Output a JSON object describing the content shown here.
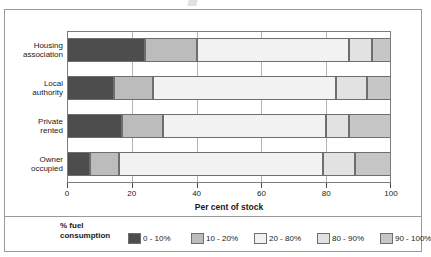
{
  "figure": {
    "frame_visible": true
  },
  "chart_data": {
    "type": "bar",
    "orientation": "horizontal",
    "stacked": true,
    "stack_mode": "percent",
    "title": "",
    "xlabel": "Per cent of stock",
    "ylabel": "",
    "xlim": [
      0,
      100
    ],
    "xticks": [
      0,
      20,
      40,
      60,
      80,
      100
    ],
    "xticklabels": [
      "0",
      "20",
      "40",
      "60",
      "80",
      "100"
    ],
    "grid": true,
    "grid_axis": "x",
    "legend_title": "% fuel consumption",
    "legend_position": "bottom",
    "categories": [
      "Housing association",
      "Local authority",
      "Private rented",
      "Owner occupied"
    ],
    "category_lines": [
      [
        "Housing",
        "association"
      ],
      [
        "Local",
        "authority"
      ],
      [
        "Private",
        "rented"
      ],
      [
        "Owner",
        "occupied"
      ]
    ],
    "series": [
      {
        "name": "0 - 10%",
        "color": "#4d4d4d",
        "values": [
          24.0,
          14.5,
          17.0,
          7.0
        ]
      },
      {
        "name": "10 - 20%",
        "color": "#bcbcbc",
        "values": [
          16.0,
          12.0,
          12.5,
          9.0
        ]
      },
      {
        "name": "20 - 80%",
        "color": "#f2f2f2",
        "values": [
          47.0,
          56.5,
          50.5,
          63.0
        ]
      },
      {
        "name": "80 - 90%",
        "color": "#e2e2e2",
        "values": [
          7.0,
          9.5,
          7.0,
          10.0
        ]
      },
      {
        "name": "90 - 100%",
        "color": "#c6c6c6",
        "values": [
          6.0,
          7.5,
          13.0,
          11.0
        ]
      }
    ]
  }
}
